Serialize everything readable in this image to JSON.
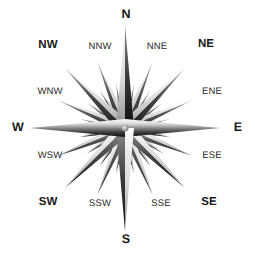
{
  "figure": {
    "name": "compass-rose",
    "background_color": "#ffffff",
    "center": {
      "x": 125,
      "y": 128
    }
  },
  "colors": {
    "label_primary": "#1a1a1a",
    "label_tertiary": "#2b2b2b",
    "ray_light": "#f2f2f2",
    "ray_mid": "#9a9a9a",
    "ray_dark": "#111111",
    "ray_shadow": "#4a4a4a"
  },
  "compass": {
    "point_count": 32,
    "labels": [
      {
        "id": "north",
        "text": "N",
        "bearing": 0,
        "tier": "primary",
        "x": 126,
        "y": 14
      },
      {
        "id": "nne",
        "text": "NNE",
        "bearing": 22.5,
        "tier": "tertiary",
        "x": 157,
        "y": 47
      },
      {
        "id": "ne",
        "text": "NE",
        "bearing": 45,
        "tier": "secondary",
        "x": 206,
        "y": 45
      },
      {
        "id": "ene",
        "text": "ENE",
        "bearing": 67.5,
        "tier": "tertiary",
        "x": 212,
        "y": 92
      },
      {
        "id": "east",
        "text": "E",
        "bearing": 90,
        "tier": "primary",
        "x": 238,
        "y": 127
      },
      {
        "id": "ese",
        "text": "ESE",
        "bearing": 112.5,
        "tier": "tertiary",
        "x": 212,
        "y": 156
      },
      {
        "id": "se",
        "text": "SE",
        "bearing": 135,
        "tier": "secondary",
        "x": 209,
        "y": 203
      },
      {
        "id": "sse",
        "text": "SSE",
        "bearing": 157.5,
        "tier": "tertiary",
        "x": 161,
        "y": 204
      },
      {
        "id": "south",
        "text": "S",
        "bearing": 180,
        "tier": "primary",
        "x": 126,
        "y": 239
      },
      {
        "id": "ssw",
        "text": "SSW",
        "bearing": 202.5,
        "tier": "tertiary",
        "x": 100,
        "y": 204
      },
      {
        "id": "sw",
        "text": "SW",
        "bearing": 225,
        "tier": "secondary",
        "x": 48,
        "y": 203
      },
      {
        "id": "wsw",
        "text": "WSW",
        "bearing": 247.5,
        "tier": "tertiary",
        "x": 50,
        "y": 156
      },
      {
        "id": "west",
        "text": "W",
        "bearing": 270,
        "tier": "primary",
        "x": 18,
        "y": 127
      },
      {
        "id": "wnw",
        "text": "WNW",
        "bearing": 292.5,
        "tier": "tertiary",
        "x": 50,
        "y": 92
      },
      {
        "id": "nw",
        "text": "NW",
        "bearing": 315,
        "tier": "secondary",
        "x": 48,
        "y": 46
      },
      {
        "id": "nnw",
        "text": "NNW",
        "bearing": 337.5,
        "tier": "tertiary",
        "x": 100,
        "y": 47
      }
    ],
    "rays": [
      {
        "bearing": 0,
        "length": 103,
        "half_width": 9,
        "tier": "primary"
      },
      {
        "bearing": 90,
        "length": 95,
        "half_width": 9,
        "tier": "primary"
      },
      {
        "bearing": 180,
        "length": 103,
        "half_width": 9,
        "tier": "primary"
      },
      {
        "bearing": 270,
        "length": 95,
        "half_width": 9,
        "tier": "primary"
      },
      {
        "bearing": 45,
        "length": 84,
        "half_width": 7.5,
        "tier": "secondary"
      },
      {
        "bearing": 135,
        "length": 84,
        "half_width": 7.5,
        "tier": "secondary"
      },
      {
        "bearing": 225,
        "length": 84,
        "half_width": 7.5,
        "tier": "secondary"
      },
      {
        "bearing": 315,
        "length": 84,
        "half_width": 7.5,
        "tier": "secondary"
      },
      {
        "bearing": 22.5,
        "length": 72,
        "half_width": 6,
        "tier": "tertiary"
      },
      {
        "bearing": 67.5,
        "length": 72,
        "half_width": 6,
        "tier": "tertiary"
      },
      {
        "bearing": 112.5,
        "length": 72,
        "half_width": 6,
        "tier": "tertiary"
      },
      {
        "bearing": 157.5,
        "length": 72,
        "half_width": 6,
        "tier": "tertiary"
      },
      {
        "bearing": 202.5,
        "length": 72,
        "half_width": 6,
        "tier": "tertiary"
      },
      {
        "bearing": 247.5,
        "length": 72,
        "half_width": 6,
        "tier": "tertiary"
      },
      {
        "bearing": 292.5,
        "length": 72,
        "half_width": 6,
        "tier": "tertiary"
      },
      {
        "bearing": 337.5,
        "length": 72,
        "half_width": 6,
        "tier": "tertiary"
      },
      {
        "bearing": 11.25,
        "length": 46,
        "half_width": 4.5,
        "tier": "quaternary"
      },
      {
        "bearing": 33.75,
        "length": 46,
        "half_width": 4.5,
        "tier": "quaternary"
      },
      {
        "bearing": 56.25,
        "length": 46,
        "half_width": 4.5,
        "tier": "quaternary"
      },
      {
        "bearing": 78.75,
        "length": 46,
        "half_width": 4.5,
        "tier": "quaternary"
      },
      {
        "bearing": 101.25,
        "length": 46,
        "half_width": 4.5,
        "tier": "quaternary"
      },
      {
        "bearing": 123.75,
        "length": 46,
        "half_width": 4.5,
        "tier": "quaternary"
      },
      {
        "bearing": 146.25,
        "length": 46,
        "half_width": 4.5,
        "tier": "quaternary"
      },
      {
        "bearing": 168.75,
        "length": 46,
        "half_width": 4.5,
        "tier": "quaternary"
      },
      {
        "bearing": 191.25,
        "length": 46,
        "half_width": 4.5,
        "tier": "quaternary"
      },
      {
        "bearing": 213.75,
        "length": 46,
        "half_width": 4.5,
        "tier": "quaternary"
      },
      {
        "bearing": 236.25,
        "length": 46,
        "half_width": 4.5,
        "tier": "quaternary"
      },
      {
        "bearing": 258.75,
        "length": 46,
        "half_width": 4.5,
        "tier": "quaternary"
      },
      {
        "bearing": 281.25,
        "length": 46,
        "half_width": 4.5,
        "tier": "quaternary"
      },
      {
        "bearing": 303.75,
        "length": 46,
        "half_width": 4.5,
        "tier": "quaternary"
      },
      {
        "bearing": 326.25,
        "length": 46,
        "half_width": 4.5,
        "tier": "quaternary"
      },
      {
        "bearing": 348.75,
        "length": 46,
        "half_width": 4.5,
        "tier": "quaternary"
      }
    ]
  }
}
